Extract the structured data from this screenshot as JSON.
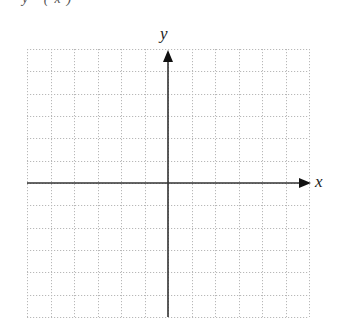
{
  "header_fragment": "y (x)",
  "graph": {
    "grid": {
      "columns": 12,
      "rows": 12,
      "left": 27,
      "top": 49,
      "right": 309,
      "bottom": 317,
      "line_color": "#b8b8b8",
      "line_style": "dotted"
    },
    "x_axis": {
      "label": "x",
      "y": 183,
      "x_start": 27,
      "x_end": 311,
      "color": "#333333"
    },
    "y_axis": {
      "label": "y",
      "x": 168,
      "y_start": 317,
      "y_end": 49,
      "color": "#333333"
    }
  },
  "chart_data": {
    "type": "scatter",
    "title": "",
    "xlabel": "x",
    "ylabel": "y",
    "x": [],
    "y": [],
    "grid": true,
    "xlim": [
      -6,
      6
    ],
    "ylim": [
      -6,
      6
    ],
    "note": "Blank coordinate grid with arrowed x and y axes; no tick labels or data plotted"
  }
}
